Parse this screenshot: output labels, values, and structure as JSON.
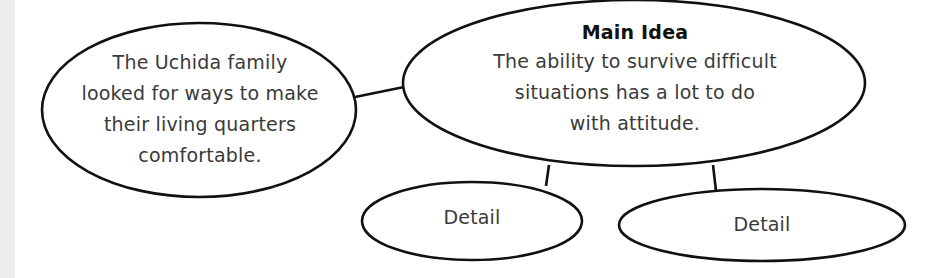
{
  "diagram": {
    "type": "main-idea web",
    "colors": {
      "stroke": "#111111",
      "text": "#3a3a3a",
      "title": "#111111",
      "background": "#ffffff",
      "left_strip": "#eeeeee"
    },
    "main_idea": {
      "title": "Main Idea",
      "lines": [
        "The ability to survive difficult",
        "situations has a lot to do",
        "with attitude."
      ]
    },
    "left_node": {
      "lines": [
        "The Uchida family",
        "looked for ways to make",
        "their living quarters",
        "comfortable."
      ]
    },
    "details": [
      {
        "label": "Detail"
      },
      {
        "label": "Detail"
      }
    ]
  }
}
